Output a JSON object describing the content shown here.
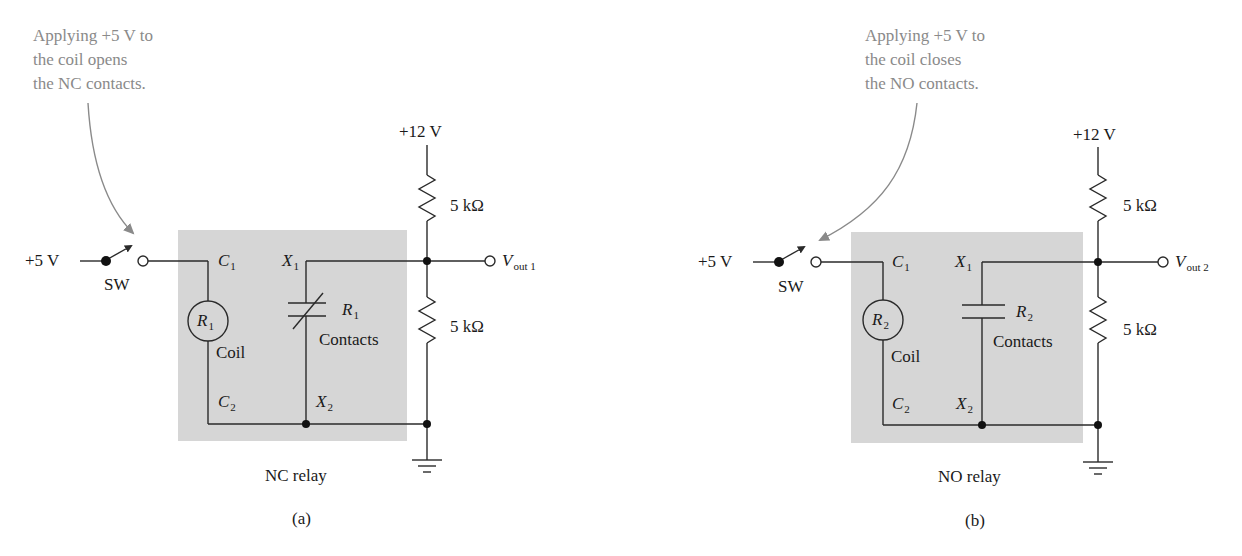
{
  "figure": {
    "panels": [
      {
        "id": "a",
        "caption": "(a)",
        "relay_label": "NC relay",
        "annotation": "Applying +5 V to\nthe coil opens\nthe NC contacts.",
        "input_voltage": "+5 V",
        "switch_label": "SW",
        "supply_voltage": "+12 V",
        "resistor_top": "5 kΩ",
        "resistor_bottom": "5 kΩ",
        "output_label": {
          "main": "V",
          "sub": "out 1"
        },
        "coil": {
          "ref": "R",
          "ref_sub": "1",
          "label": "Coil",
          "terminal_top": {
            "main": "C",
            "sub": "1"
          },
          "terminal_bottom": {
            "main": "C",
            "sub": "2"
          }
        },
        "contacts": {
          "ref": "R",
          "ref_sub": "1",
          "label": "Contacts",
          "type": "normally-closed",
          "terminal_top": {
            "main": "X",
            "sub": "1"
          },
          "terminal_bottom": {
            "main": "X",
            "sub": "2"
          }
        }
      },
      {
        "id": "b",
        "caption": "(b)",
        "relay_label": "NO relay",
        "annotation": "Applying +5 V to\nthe coil closes\nthe NO contacts.",
        "input_voltage": "+5 V",
        "switch_label": "SW",
        "supply_voltage": "+12 V",
        "resistor_top": "5 kΩ",
        "resistor_bottom": "5 kΩ",
        "output_label": {
          "main": "V",
          "sub": "out 2"
        },
        "coil": {
          "ref": "R",
          "ref_sub": "2",
          "label": "Coil",
          "terminal_top": {
            "main": "C",
            "sub": "1"
          },
          "terminal_bottom": {
            "main": "C",
            "sub": "2"
          }
        },
        "contacts": {
          "ref": "R",
          "ref_sub": "2",
          "label": "Contacts",
          "type": "normally-open",
          "terminal_top": {
            "main": "X",
            "sub": "1"
          },
          "terminal_bottom": {
            "main": "X",
            "sub": "2"
          }
        }
      }
    ]
  },
  "colors": {
    "wire": "#2a2a2a",
    "relay_shade": "#d6d6d6",
    "annotation": "#8a8a8a"
  }
}
